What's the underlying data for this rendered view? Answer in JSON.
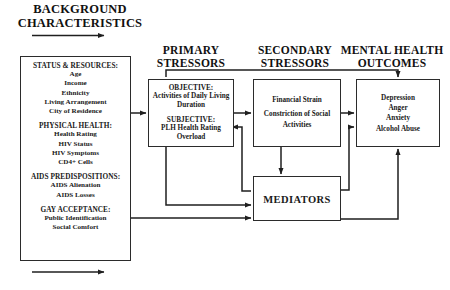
{
  "diagram": {
    "headers": {
      "background": "BACKGROUND\nCHARACTERISTICS",
      "background_line1": "BACKGROUND",
      "background_line2": "CHARACTERISTICS",
      "primary_line1": "PRIMARY",
      "primary_line2": "STRESSORS",
      "secondary_line1": "SECONDARY",
      "secondary_line2": "STRESSORS",
      "mental_line1": "MENTAL HEALTH",
      "mental_line2": "OUTCOMES"
    },
    "background_box": {
      "groups": [
        {
          "title": "STATUS & RESOURCES:",
          "items": [
            "Age",
            "Income",
            "Ethnicity",
            "Living Arrangement",
            "City of Residence"
          ]
        },
        {
          "title": "PHYSICAL HEALTH:",
          "items": [
            "Health Rating",
            "HIV Status",
            "HIV Symptoms",
            "CD4+ Cells"
          ]
        },
        {
          "title": "AIDS PREDISPOSITIONS:",
          "items": [
            "AIDS Alienation",
            "AIDS Losses"
          ]
        },
        {
          "title": "GAY ACCEPTANCE:",
          "items": [
            "Public Identification",
            "Social Comfort"
          ]
        }
      ]
    },
    "primary_box": {
      "groups": [
        {
          "title": "OBJECTIVE:",
          "items": [
            "Activities of Daily Living",
            "Duration"
          ]
        },
        {
          "title": "SUBJECTIVE:",
          "items": [
            "PLH Health Rating",
            "Overload"
          ]
        }
      ]
    },
    "secondary_box": {
      "items": [
        "Financial Strain",
        "Constriction of Social Activities"
      ],
      "item1": "Financial Strain",
      "item2_line1": "Constriction of Social",
      "item2_line2": "Activities"
    },
    "mental_box": {
      "items": [
        "Depression",
        "Anger",
        "Anxiety",
        "Alcohol Abuse"
      ]
    },
    "mediators_box": {
      "label": "MEDIATORS"
    },
    "colors": {
      "stroke": "#2b2b2b",
      "text": "#111111",
      "background": "#ffffff"
    }
  }
}
